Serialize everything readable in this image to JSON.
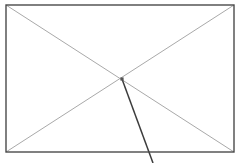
{
  "figure": {
    "canvas": {
      "width": 242,
      "height": 163,
      "background": "#ffffff"
    },
    "colors": {
      "rectangle_stroke": "#4a4a4a",
      "diagonal_stroke": "#a9a9a9",
      "leader_stroke": "#3c3c3c",
      "center_marker_fill": "#555555"
    },
    "rectangle": {
      "name": "outer-rectangle",
      "x": 6,
      "y": 5,
      "width": 228,
      "height": 147,
      "stroke_width": 1.4,
      "fill": "none"
    },
    "diagonals": [
      {
        "name": "diagonal-top-left-to-bottom-right",
        "x1": 6,
        "y1": 5,
        "x2": 234,
        "y2": 152,
        "stroke_width": 1.0
      },
      {
        "name": "diagonal-bottom-left-to-top-right",
        "x1": 6,
        "y1": 152,
        "x2": 234,
        "y2": 5,
        "stroke_width": 1.0
      }
    ],
    "center_point": {
      "name": "diagonal-intersection-marker",
      "x": 122,
      "y": 79,
      "size": 3.2
    },
    "leader_line": {
      "name": "leader-line-from-center",
      "x1": 122,
      "y1": 79,
      "x2": 153,
      "y2": 163,
      "stroke_width": 1.5
    }
  }
}
